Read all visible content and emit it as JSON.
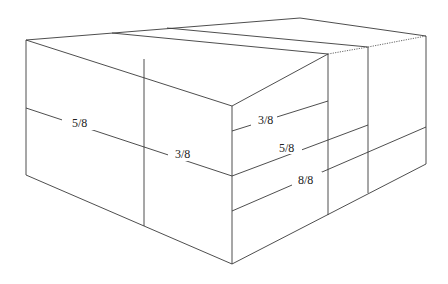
{
  "diagram": {
    "labels": [
      {
        "id": "left-5-8",
        "text": "5/8",
        "x": 44,
        "y": 128
      },
      {
        "id": "left-3-8",
        "text": "3/8",
        "x": 173,
        "y": 159
      },
      {
        "id": "front-3-8",
        "text": "3/8",
        "x": 258,
        "y": 126
      },
      {
        "id": "front-5-8",
        "text": "5/8",
        "x": 279,
        "y": 152
      },
      {
        "id": "front-8-8",
        "text": "8/8",
        "x": 298,
        "y": 184
      }
    ],
    "line_color": "#3a3a3a",
    "background": "#ffffff"
  }
}
